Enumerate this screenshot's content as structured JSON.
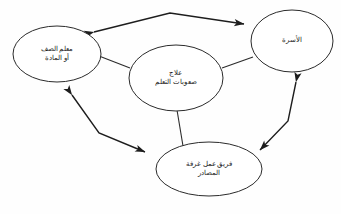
{
  "diagram": {
    "title": "علاج صعوبات التعلم",
    "language": "ar",
    "direction": "rtl",
    "background_color": "#fefefe",
    "stroke_color": "#2b2b2b",
    "text_color": "#1a1a1a"
  },
  "nodes": {
    "teacher": {
      "id": "teacher",
      "line1": "معلم الصف",
      "line2": "أو المادة",
      "cx": 57,
      "cy": 54,
      "rx": 44,
      "ry": 28
    },
    "treatment": {
      "id": "treatment",
      "line1": "علاج",
      "line2": "صعوبات التعلم",
      "cx": 176,
      "cy": 78,
      "rx": 47,
      "ry": 33
    },
    "family": {
      "id": "family",
      "line1": "الأسرة",
      "line2": "",
      "cx": 292,
      "cy": 41,
      "rx": 41,
      "ry": 31
    },
    "resource_room": {
      "id": "resource_room",
      "line1": "فريق عمل غرفة",
      "line2": "المصادر",
      "cx": 209,
      "cy": 169,
      "rx": 53,
      "ry": 27
    }
  },
  "connectors": {
    "teacher_family": {
      "name": "teacher-family-connector",
      "arrows": "both",
      "path": "M 94,32 L 170,13 L 244,24"
    },
    "teacher_resource": {
      "name": "teacher-resource-connector",
      "arrows": "both",
      "path": "M 72,95 L 99,133 L 145,152"
    },
    "family_resource": {
      "name": "family-resource-connector",
      "arrows": "both",
      "path": "M 296,82 L 288,121 L 260,150"
    },
    "treatment_teacher": {
      "name": "treatment-teacher-connector",
      "arrows": "none",
      "path": "M 99,56 L 130,68"
    },
    "treatment_family": {
      "name": "treatment-family-connector",
      "arrows": "none",
      "path": "M 222,68 L 253,57"
    },
    "treatment_resource": {
      "name": "treatment-resource-connector",
      "arrows": "none",
      "path": "M 177,110 L 183,146"
    }
  }
}
